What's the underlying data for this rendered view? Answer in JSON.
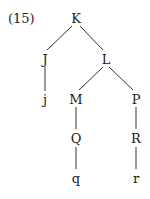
{
  "example_number": "(15)",
  "tree": {
    "nodes": [
      {
        "id": "K",
        "label": "K",
        "x": 76,
        "y": 18
      },
      {
        "id": "J",
        "label": "J",
        "x": 45,
        "y": 59
      },
      {
        "id": "L",
        "label": "L",
        "x": 106,
        "y": 59
      },
      {
        "id": "j",
        "label": "j",
        "x": 45,
        "y": 99
      },
      {
        "id": "M",
        "label": "M",
        "x": 76,
        "y": 99
      },
      {
        "id": "P",
        "label": "P",
        "x": 136,
        "y": 99
      },
      {
        "id": "Q",
        "label": "Q",
        "x": 76,
        "y": 138
      },
      {
        "id": "R",
        "label": "R",
        "x": 136,
        "y": 138
      },
      {
        "id": "q",
        "label": "q",
        "x": 76,
        "y": 178
      },
      {
        "id": "r",
        "label": "r",
        "x": 136,
        "y": 178
      }
    ],
    "edges": [
      [
        "K",
        "J"
      ],
      [
        "K",
        "L"
      ],
      [
        "J",
        "j"
      ],
      [
        "L",
        "M"
      ],
      [
        "L",
        "P"
      ],
      [
        "M",
        "Q"
      ],
      [
        "Q",
        "q"
      ],
      [
        "P",
        "R"
      ],
      [
        "R",
        "r"
      ]
    ]
  }
}
